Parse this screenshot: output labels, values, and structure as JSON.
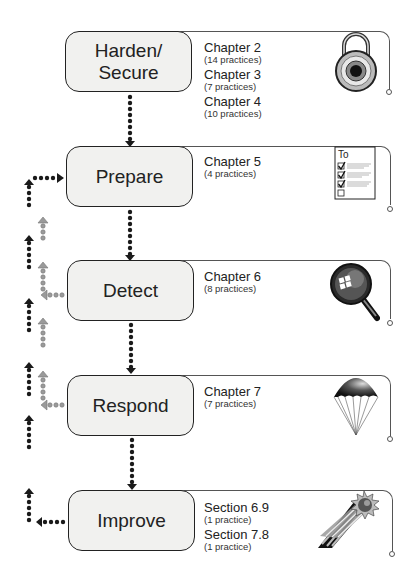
{
  "diagram": {
    "stages": [
      {
        "id": "harden",
        "label_line1": "Harden/",
        "label_line2": "Secure",
        "icon": "padlock-icon",
        "references": [
          {
            "title": "Chapter 2",
            "count": "(14 practices)"
          },
          {
            "title": "Chapter 3",
            "count": "(7 practices)"
          },
          {
            "title": "Chapter 4",
            "count": "(10 practices)"
          }
        ]
      },
      {
        "id": "prepare",
        "label_line1": "Prepare",
        "icon": "todo-checklist-icon",
        "icon_text": "To",
        "references": [
          {
            "title": "Chapter 5",
            "count": "(4 practices)"
          }
        ]
      },
      {
        "id": "detect",
        "label_line1": "Detect",
        "icon": "magnifying-glass-icon",
        "references": [
          {
            "title": "Chapter 6",
            "count": "(8 practices)"
          }
        ]
      },
      {
        "id": "respond",
        "label_line1": "Respond",
        "icon": "parachute-icon",
        "references": [
          {
            "title": "Chapter 7",
            "count": "(7 practices)"
          }
        ]
      },
      {
        "id": "improve",
        "label_line1": "Improve",
        "icon": "shooting-star-icon",
        "references": [
          {
            "title": "Section 6.9",
            "count": "(1 practice)"
          },
          {
            "title": "Section 7.8",
            "count": "(1 practice)"
          }
        ]
      }
    ],
    "colors": {
      "box_fill": "#f1f1ef",
      "box_border": "#222222",
      "primary_arrow": "#1a1a1a",
      "feedback_arrow_gray": "#9a9a9a"
    }
  }
}
